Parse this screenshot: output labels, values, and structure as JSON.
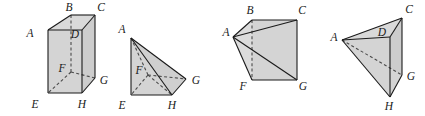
{
  "figure": {
    "background_color": "#ffffff",
    "face_fill_color": "#d4d4d4",
    "face_fill_color_light": "#dcdcdc",
    "edge_color": "#1a1a1a",
    "hidden_edge_color": "#4a4a4a",
    "label_color": "#1a1a1a",
    "edge_width": 1.1,
    "hidden_dash": "3,2.4"
  },
  "figures": [
    {
      "name": "cube",
      "caption": "cube ABCDEFGH",
      "vertices": [
        {
          "id": "A",
          "label": "A",
          "x": 48,
          "y": 30,
          "lx": 30,
          "ly": 37
        },
        {
          "id": "B",
          "label": "B",
          "x": 88,
          "y": 17,
          "lx": 81,
          "ly": 12
        },
        {
          "id": "C",
          "label": "C",
          "x": 82,
          "y": 17,
          "lx": 84,
          "ly": 12
        },
        {
          "id": "D",
          "label": "D",
          "x": 82,
          "y": 30,
          "lx": 60,
          "ly": 37
        },
        {
          "id": "E",
          "label": "E",
          "x": 48,
          "y": 93,
          "lx": 31,
          "ly": 105
        },
        {
          "id": "F",
          "label": "F",
          "x": 88,
          "y": 75,
          "lx": 22,
          "ly": 71
        },
        {
          "id": "G",
          "label": "G",
          "x": 82,
          "y": 75,
          "lx": 86,
          "ly": 80
        },
        {
          "id": "H",
          "label": "H",
          "x": 82,
          "y": 93,
          "lx": 65,
          "ly": 105
        }
      ]
    },
    {
      "name": "pyramid-aefgh",
      "caption": "pyramid A-EFGH",
      "vertices": [
        {
          "id": "A",
          "label": "A",
          "lx": 116,
          "ly": 36
        },
        {
          "id": "E",
          "label": "E",
          "lx": 116,
          "ly": 105
        },
        {
          "id": "F",
          "label": "F",
          "lx": 134,
          "ly": 74
        },
        {
          "id": "G",
          "label": "G",
          "lx": 190,
          "ly": 78
        },
        {
          "id": "H",
          "label": "H",
          "lx": 163,
          "ly": 105
        }
      ]
    },
    {
      "name": "pyramid-abcgf",
      "caption": "pyramid A-BCGF",
      "vertices": [
        {
          "id": "A",
          "label": "A",
          "lx": 225,
          "ly": 37
        },
        {
          "id": "B",
          "label": "B",
          "lx": 243,
          "ly": 12
        },
        {
          "id": "C",
          "label": "C",
          "lx": 300,
          "ly": 12
        },
        {
          "id": "F",
          "label": "F",
          "lx": 239,
          "ly": 79
        },
        {
          "id": "G",
          "label": "G",
          "lx": 300,
          "ly": 79
        }
      ]
    },
    {
      "name": "pyramid-acdgh",
      "caption": "pyramid A-CDGH",
      "vertices": [
        {
          "id": "A",
          "label": "A",
          "lx": 330,
          "ly": 41
        },
        {
          "id": "C",
          "label": "C",
          "lx": 407,
          "ly": 12
        },
        {
          "id": "D",
          "label": "D",
          "lx": 383,
          "ly": 38
        },
        {
          "id": "G",
          "label": "G",
          "lx": 409,
          "ly": 78
        },
        {
          "id": "H",
          "label": "H",
          "lx": 384,
          "ly": 105
        }
      ]
    }
  ]
}
